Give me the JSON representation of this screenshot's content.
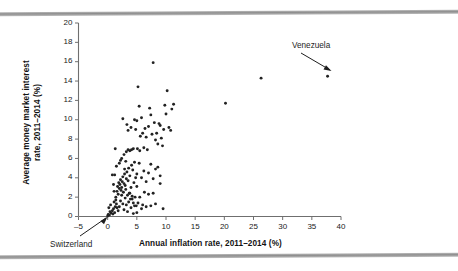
{
  "figure": {
    "background_color": "#ffffff",
    "rule_color": "#9a9a9a",
    "point_color": "#222222",
    "axis_color": "#6f6f6f"
  },
  "axes": {
    "x_title": "Annual inflation rate, 2011–2014 (%)",
    "y_title_line1": "Average money market interest",
    "y_title_line2": "rate, 2011–2014 (%)",
    "x_ticks": [
      "-5",
      "0",
      "5",
      "10",
      "15",
      "20",
      "25",
      "30",
      "35",
      "40"
    ],
    "y_ticks": [
      "0",
      "2",
      "4",
      "6",
      "8",
      "10",
      "12",
      "14",
      "16",
      "18",
      "20"
    ]
  },
  "annotations": [
    {
      "name": "venezuela",
      "label": "Venezuela",
      "point_x": 37.7,
      "point_y": 14.5
    },
    {
      "name": "switzerland",
      "label": "Switzerland",
      "point_x": 0.0,
      "point_y": 0.05
    }
  ],
  "chart_data": {
    "type": "scatter",
    "title": "",
    "xlabel": "Annual inflation rate, 2011–2014 (%)",
    "ylabel": "Average money market interest rate, 2011–2014 (%)",
    "xlim": [
      -5,
      40
    ],
    "ylim": [
      0,
      20
    ],
    "x_tick_step": 5,
    "y_tick_step": 2,
    "grid": false,
    "legend": "none",
    "marker": "filled-circle",
    "annotated_points": [
      {
        "label": "Venezuela",
        "x": 37.7,
        "y": 14.5
      },
      {
        "label": "Switzerland",
        "x": 0.0,
        "y": 0.05
      }
    ],
    "points": [
      [
        0.0,
        0.05
      ],
      [
        0.1,
        0.2
      ],
      [
        0.3,
        0.15
      ],
      [
        0.4,
        0.5
      ],
      [
        0.2,
        0.9
      ],
      [
        0.6,
        0.35
      ],
      [
        0.8,
        0.6
      ],
      [
        0.5,
        1.2
      ],
      [
        0.9,
        0.25
      ],
      [
        1.0,
        0.8
      ],
      [
        1.1,
        1.5
      ],
      [
        1.2,
        0.4
      ],
      [
        1.3,
        1.0
      ],
      [
        1.4,
        2.0
      ],
      [
        1.5,
        1.3
      ],
      [
        1.6,
        2.6
      ],
      [
        1.7,
        3.1
      ],
      [
        1.8,
        2.3
      ],
      [
        1.9,
        3.5
      ],
      [
        2.0,
        2.9
      ],
      [
        2.1,
        3.3
      ],
      [
        2.2,
        3.8
      ],
      [
        2.3,
        2.7
      ],
      [
        2.4,
        3.0
      ],
      [
        2.5,
        3.6
      ],
      [
        2.6,
        4.1
      ],
      [
        2.7,
        2.5
      ],
      [
        2.8,
        3.4
      ],
      [
        2.9,
        4.4
      ],
      [
        3.0,
        3.2
      ],
      [
        3.1,
        2.8
      ],
      [
        3.2,
        3.9
      ],
      [
        3.3,
        4.6
      ],
      [
        3.4,
        2.2
      ],
      [
        3.5,
        3.7
      ],
      [
        3.6,
        5.0
      ],
      [
        3.7,
        2.4
      ],
      [
        3.8,
        4.2
      ],
      [
        3.9,
        1.8
      ],
      [
        4.0,
        3.0
      ],
      [
        4.1,
        5.3
      ],
      [
        4.2,
        2.1
      ],
      [
        4.3,
        4.8
      ],
      [
        4.4,
        1.4
      ],
      [
        4.5,
        3.5
      ],
      [
        4.6,
        5.6
      ],
      [
        4.7,
        2.0
      ],
      [
        4.8,
        4.0
      ],
      [
        4.9,
        1.1
      ],
      [
        5.0,
        3.1
      ],
      [
        1.2,
        4.3
      ],
      [
        1.5,
        5.2
      ],
      [
        2.0,
        5.5
      ],
      [
        2.4,
        6.0
      ],
      [
        2.8,
        6.4
      ],
      [
        3.2,
        6.7
      ],
      [
        3.5,
        6.9
      ],
      [
        3.8,
        6.8
      ],
      [
        4.1,
        6.9
      ],
      [
        4.4,
        7.0
      ],
      [
        1.3,
        7.0
      ],
      [
        2.6,
        10.1
      ],
      [
        3.3,
        9.5
      ],
      [
        3.5,
        8.9
      ],
      [
        4.0,
        9.2
      ],
      [
        4.6,
        10.0
      ],
      [
        4.8,
        9.0
      ],
      [
        5.0,
        9.9
      ],
      [
        5.2,
        13.4
      ],
      [
        5.4,
        11.4
      ],
      [
        5.6,
        8.3
      ],
      [
        5.8,
        10.2
      ],
      [
        6.0,
        8.6
      ],
      [
        6.2,
        7.1
      ],
      [
        6.4,
        9.1
      ],
      [
        6.6,
        8.2
      ],
      [
        6.8,
        6.9
      ],
      [
        7.0,
        9.3
      ],
      [
        7.2,
        11.2
      ],
      [
        7.4,
        10.5
      ],
      [
        7.6,
        8.5
      ],
      [
        7.8,
        15.9
      ],
      [
        8.0,
        9.7
      ],
      [
        8.2,
        7.9
      ],
      [
        8.4,
        8.6
      ],
      [
        8.6,
        7.5
      ],
      [
        8.8,
        9.6
      ],
      [
        9.0,
        9.4
      ],
      [
        9.2,
        8.1
      ],
      [
        9.4,
        7.3
      ],
      [
        9.6,
        9.0
      ],
      [
        9.8,
        11.5
      ],
      [
        10.0,
        10.6
      ],
      [
        10.2,
        13.0
      ],
      [
        10.5,
        9.2
      ],
      [
        10.8,
        8.9
      ],
      [
        11.0,
        11.1
      ],
      [
        11.3,
        11.6
      ],
      [
        9.0,
        4.2
      ],
      [
        9.5,
        0.8
      ],
      [
        0.8,
        4.3
      ],
      [
        1.0,
        3.3
      ],
      [
        1.1,
        2.6
      ],
      [
        1.4,
        1.7
      ],
      [
        1.6,
        0.9
      ],
      [
        1.8,
        0.6
      ],
      [
        2.0,
        1.0
      ],
      [
        2.2,
        1.6
      ],
      [
        2.4,
        2.2
      ],
      [
        2.6,
        1.3
      ],
      [
        2.8,
        0.7
      ],
      [
        3.0,
        1.9
      ],
      [
        3.2,
        1.2
      ],
      [
        3.4,
        0.5
      ],
      [
        3.6,
        1.5
      ],
      [
        3.8,
        2.4
      ],
      [
        4.0,
        0.9
      ],
      [
        4.2,
        1.8
      ],
      [
        4.4,
        0.3
      ],
      [
        4.6,
        1.1
      ],
      [
        5.0,
        0.4
      ],
      [
        5.2,
        1.4
      ],
      [
        5.5,
        2.0
      ],
      [
        5.8,
        0.8
      ],
      [
        6.0,
        1.2
      ],
      [
        6.3,
        2.5
      ],
      [
        6.6,
        1.0
      ],
      [
        7.0,
        2.3
      ],
      [
        7.4,
        1.1
      ],
      [
        7.8,
        2.4
      ],
      [
        8.2,
        1.3
      ],
      [
        5.0,
        4.4
      ],
      [
        5.4,
        5.5
      ],
      [
        5.8,
        4.0
      ],
      [
        6.2,
        4.7
      ],
      [
        6.6,
        3.6
      ],
      [
        7.0,
        4.5
      ],
      [
        7.4,
        5.4
      ],
      [
        7.8,
        3.9
      ],
      [
        8.2,
        4.9
      ],
      [
        8.6,
        5.1
      ],
      [
        9.0,
        3.4
      ],
      [
        2.2,
        5.8
      ],
      [
        2.9,
        4.9
      ],
      [
        3.1,
        5.7
      ],
      [
        5.1,
        7.0
      ],
      [
        5.5,
        6.8
      ],
      [
        20.2,
        11.7
      ],
      [
        26.3,
        14.3
      ],
      [
        37.7,
        14.5
      ]
    ]
  }
}
